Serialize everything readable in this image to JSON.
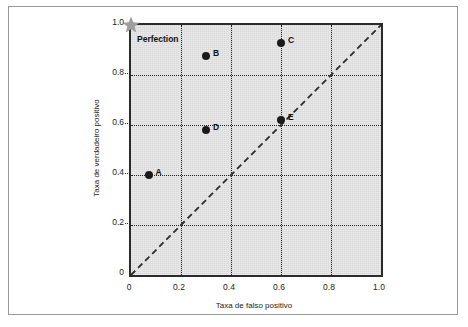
{
  "figure": {
    "background_color": "#ffffff",
    "border_color": "#9a9a9a",
    "plot_background_color": "#d9d9d9",
    "plot_border_color": "#2b2b2b",
    "grid_color": "#1d1d1d",
    "point_color": "#1a1a1a",
    "star_color": "#9e9e9e",
    "chance_line_color": "#2b2b2b"
  },
  "chart_data": {
    "type": "scatter",
    "title": "",
    "xlabel": "Taxa de falso positivo",
    "ylabel": "Taxa de verdadeiro positivo",
    "xlim": [
      0,
      1
    ],
    "ylim": [
      0,
      1
    ],
    "xticks": [
      "0",
      "0.2",
      "0.4",
      "0.6",
      "0.8",
      "1.0"
    ],
    "xtick_values": [
      0,
      0.2,
      0.4,
      0.6,
      0.8,
      1.0
    ],
    "yticks": [
      "0",
      "0.2",
      "0.4",
      "0.6",
      "0.8",
      "1.0"
    ],
    "ytick_values": [
      0,
      0.2,
      0.4,
      0.6,
      0.8,
      1.0
    ],
    "grid": true,
    "grid_style": "dotted",
    "legend": "none",
    "points": [
      {
        "label": "A",
        "x": 0.07,
        "y": 0.4
      },
      {
        "label": "B",
        "x": 0.3,
        "y": 0.875
      },
      {
        "label": "C",
        "x": 0.6,
        "y": 0.93
      },
      {
        "label": "D",
        "x": 0.3,
        "y": 0.58
      },
      {
        "label": "E",
        "x": 0.6,
        "y": 0.62
      }
    ],
    "annotations": [
      {
        "name": "perfection",
        "label": "Perfection",
        "x": 0.0,
        "y": 1.0,
        "marker": "star"
      }
    ],
    "reference_line": {
      "name": "chance-diagonal",
      "style": "dashed",
      "from": [
        0,
        0
      ],
      "to": [
        1,
        1
      ]
    }
  }
}
